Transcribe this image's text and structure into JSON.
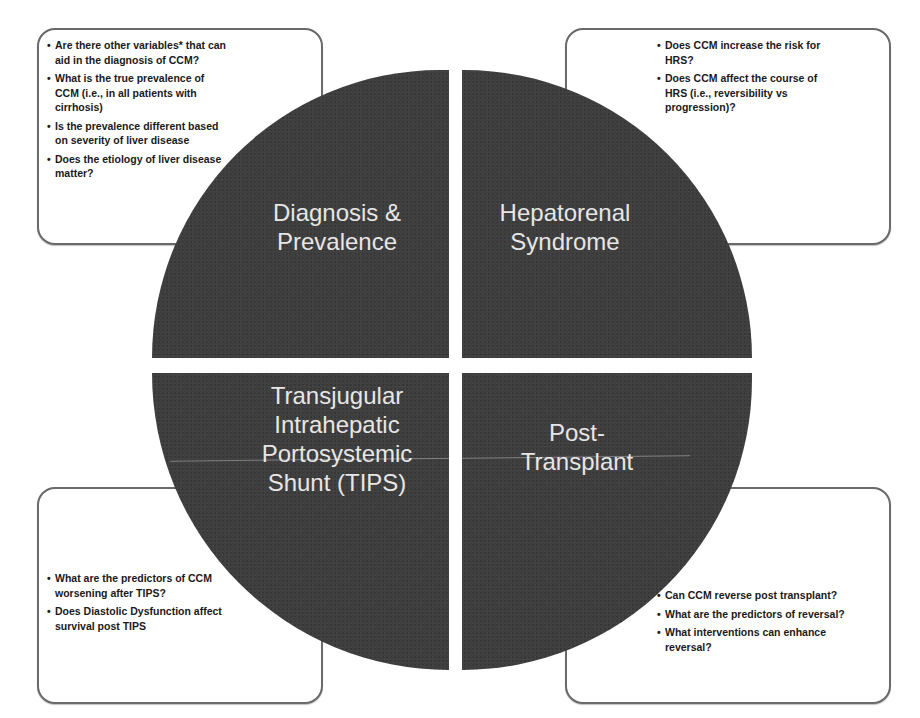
{
  "diagram": {
    "type": "four-quadrant-circle",
    "colors": {
      "circle_fill": "#3f3f3f",
      "quadrant_text": "#e6e6e6",
      "box_border": "#6a6a6a",
      "box_text": "#1a1a1a",
      "background": "#ffffff"
    },
    "quadrants": {
      "top_left": {
        "label": "Diagnosis &\nPrevalence",
        "questions": [
          "Are  there other variables* that can aid in the diagnosis of CCM?",
          "What is the true prevalence of CCM (i.e., in all patients with cirrhosis)",
          "Is the prevalence different based on  severity of liver disease",
          "Does the etiology of liver disease matter?"
        ]
      },
      "top_right": {
        "label": "Hepatorenal\nSyndrome",
        "questions": [
          "Does CCM increase the risk for HRS?",
          "Does CCM affect  the course of HRS (i.e., reversibility vs progression)?"
        ]
      },
      "bottom_left": {
        "label": "Transjugular\nIntrahepatic\nPortosystemic\nShunt (TIPS)",
        "questions": [
          "What are the predictors of CCM worsening after TIPS?",
          "Does Diastolic Dysfunction affect  survival post TIPS"
        ]
      },
      "bottom_right": {
        "label": "Post-\nTransplant",
        "questions": [
          "Can CCM reverse post transplant?",
          "What are the predictors of reversal?",
          "What interventions can enhance reversal?"
        ]
      }
    }
  }
}
